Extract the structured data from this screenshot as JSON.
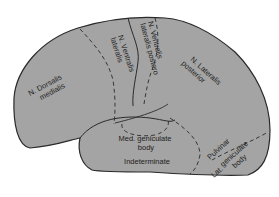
{
  "diagram": {
    "type": "anatomical-map",
    "fill_color": "#a4a4a4",
    "outline_color": "#2a2a2a",
    "labels": {
      "dorsalis_medialis": [
        "N. Dorsalis",
        "medialis"
      ],
      "ventralis_lateralis": [
        "N. Ventralis",
        "lateralis"
      ],
      "ventralis_lateralis_postero": [
        "N. Ventralis",
        "lateralis postero"
      ],
      "lateralis_posterior": [
        "N. Lateralis",
        "posterior"
      ],
      "med_geniculate": [
        "Med. geniculate",
        "body"
      ],
      "indeterminate": "Indeterminate",
      "pulvinar": "Pulvinar",
      "lat_geniculate": [
        "Lat.",
        "geniculate",
        "body"
      ]
    }
  }
}
